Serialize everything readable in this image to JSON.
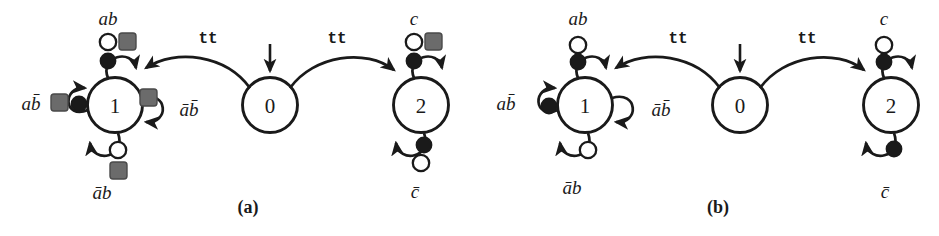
{
  "figure": {
    "kind": "state-transition-diagram-pair",
    "background_color": "#ffffff",
    "stroke_color": "#1a1a1a",
    "marker_fill_dark": "#1a1a1a",
    "marker_fill_light": "#ffffff",
    "marker_fill_gray": "#6b6b6b"
  },
  "panels": [
    {
      "id": "a",
      "caption": "(a)",
      "states": [
        {
          "id": "s1",
          "label": "1"
        },
        {
          "id": "s0",
          "label": "0"
        },
        {
          "id": "s2",
          "label": "2"
        }
      ],
      "initial_state": "0",
      "transitions": [
        {
          "from": "0",
          "to": "1",
          "label": "tt",
          "markers": []
        },
        {
          "from": "0",
          "to": "2",
          "label": "tt",
          "markers": []
        },
        {
          "from": "1",
          "to": "1",
          "label": "ab",
          "position": "top",
          "markers": [
            "open-circle",
            "gray-square",
            "filled-circle"
          ]
        },
        {
          "from": "1",
          "to": "1",
          "label": "ab̄",
          "position": "left",
          "markers": [
            "gray-square",
            "filled-circle"
          ]
        },
        {
          "from": "1",
          "to": "1",
          "label": "āb̄",
          "position": "right",
          "markers": [
            "gray-square"
          ]
        },
        {
          "from": "1",
          "to": "1",
          "label": "āb",
          "position": "bottom",
          "markers": [
            "open-circle",
            "gray-square"
          ]
        },
        {
          "from": "2",
          "to": "2",
          "label": "c",
          "position": "top",
          "markers": [
            "open-circle",
            "gray-square",
            "filled-circle"
          ]
        },
        {
          "from": "2",
          "to": "2",
          "label": "c̄",
          "position": "bottom",
          "markers": [
            "filled-circle",
            "open-circle"
          ]
        }
      ],
      "labels": {
        "tt_left": "tt",
        "tt_right": "tt",
        "s1_top": "ab",
        "s1_left": "ab̄",
        "s1_right": "āb̄",
        "s1_bottom": "āb",
        "s2_top": "c",
        "s2_bottom": "c̄"
      }
    },
    {
      "id": "b",
      "caption": "(b)",
      "states": [
        {
          "id": "s1",
          "label": "1"
        },
        {
          "id": "s0",
          "label": "0"
        },
        {
          "id": "s2",
          "label": "2"
        }
      ],
      "initial_state": "0",
      "transitions": [
        {
          "from": "0",
          "to": "1",
          "label": "tt",
          "markers": []
        },
        {
          "from": "0",
          "to": "2",
          "label": "tt",
          "markers": []
        },
        {
          "from": "1",
          "to": "1",
          "label": "ab",
          "position": "top",
          "markers": [
            "open-circle",
            "filled-circle"
          ]
        },
        {
          "from": "1",
          "to": "1",
          "label": "ab̄",
          "position": "left",
          "markers": [
            "filled-circle"
          ]
        },
        {
          "from": "1",
          "to": "1",
          "label": "āb̄",
          "position": "right",
          "markers": []
        },
        {
          "from": "1",
          "to": "1",
          "label": "āb",
          "position": "bottom",
          "markers": [
            "open-circle"
          ]
        },
        {
          "from": "2",
          "to": "2",
          "label": "c",
          "position": "top",
          "markers": [
            "open-circle",
            "filled-circle"
          ]
        },
        {
          "from": "2",
          "to": "2",
          "label": "c̄",
          "position": "bottom",
          "markers": [
            "filled-circle"
          ]
        }
      ],
      "labels": {
        "tt_left": "tt",
        "tt_right": "tt",
        "s1_top": "ab",
        "s1_left": "ab̄",
        "s1_right": "āb̄",
        "s1_bottom": "āb",
        "s2_top": "c",
        "s2_bottom": "c̄"
      }
    }
  ]
}
